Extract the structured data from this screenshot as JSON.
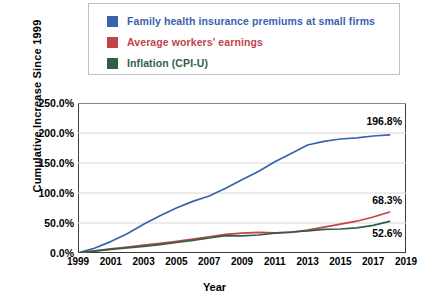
{
  "chart_data": {
    "type": "line",
    "title": "",
    "xlabel": "Year",
    "ylabel": "Cumulative Increase Since 1999",
    "xlim": [
      1999,
      2019
    ],
    "ylim": [
      0,
      250
    ],
    "grid": true,
    "legend_position": "top",
    "ytick_labels": [
      "250.0%",
      "200.0%",
      "150.0%",
      "100.0%",
      "50.0%",
      "0.0%"
    ],
    "ytick_values": [
      250,
      200,
      150,
      100,
      50,
      0
    ],
    "xtick_labels": [
      "1999",
      "2001",
      "2003",
      "2005",
      "2007",
      "2009",
      "2011",
      "2013",
      "2015",
      "2017",
      "2019"
    ],
    "xtick_values": [
      1999,
      2001,
      2003,
      2005,
      2007,
      2009,
      2011,
      2013,
      2015,
      2017,
      2019
    ],
    "x": [
      1999,
      2000,
      2001,
      2002,
      2003,
      2004,
      2005,
      2006,
      2007,
      2008,
      2009,
      2010,
      2011,
      2012,
      2013,
      2014,
      2015,
      2016,
      2017,
      2018
    ],
    "series": [
      {
        "name": "Family health insurance premiums at small firms",
        "color": "#3a62ad",
        "values": [
          0,
          8.0,
          19.0,
          32.0,
          48.0,
          62.0,
          75.0,
          86.0,
          95.0,
          108.0,
          122.0,
          136.0,
          152.0,
          166.0,
          180.0,
          186.0,
          190.0,
          192.0,
          195.0,
          196.8
        ],
        "end_label": "196.8%"
      },
      {
        "name": "Average workers' earnings",
        "color": "#c1444a",
        "values": [
          0,
          3.5,
          7.0,
          10.0,
          13.0,
          16.0,
          19.5,
          23.0,
          27.0,
          31.0,
          33.0,
          34.5,
          33.5,
          34.5,
          38.0,
          43.0,
          48.0,
          53.0,
          60.0,
          68.3
        ],
        "end_label": "68.3%"
      },
      {
        "name": "Inflation (CPI-U)",
        "color": "#2f5f45",
        "values": [
          0,
          3.0,
          6.0,
          8.5,
          11.0,
          14.0,
          17.5,
          21.0,
          25.0,
          29.0,
          28.5,
          30.0,
          33.0,
          35.0,
          37.0,
          39.5,
          40.0,
          42.0,
          46.0,
          52.6
        ],
        "end_label": "52.6%"
      }
    ]
  },
  "legend": {
    "items": [
      {
        "label": "Family health insurance premiums at small firms",
        "color": "#3a62ad"
      },
      {
        "label": "Average workers' earnings",
        "color": "#c1444a"
      },
      {
        "label": "Inflation (CPI-U)",
        "color": "#2f5f45"
      }
    ]
  },
  "axes": {
    "y_title": "Cumulative Increase Since 1999",
    "x_title": "Year"
  }
}
